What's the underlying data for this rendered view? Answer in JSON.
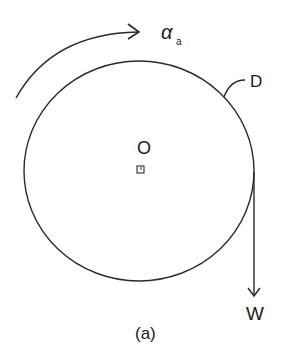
{
  "diagram": {
    "caption": "(a)",
    "labels": {
      "angular_acceleration": "α",
      "angular_acceleration_sub": "a",
      "disk": "D",
      "center": "O",
      "weight": "W"
    },
    "colors": {
      "stroke": "#2a2a2a",
      "background": "#ffffff"
    },
    "elements": [
      "disk-circle",
      "center-marker",
      "rotation-arrow",
      "weight-force-arrow",
      "disk-leader-line"
    ]
  }
}
